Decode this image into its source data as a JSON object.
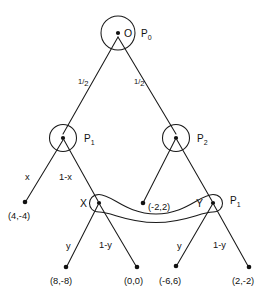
{
  "diagram": {
    "type": "extensive-form-game-tree",
    "nodes": [
      {
        "id": "root",
        "label": "O",
        "player": "P",
        "player_sub": "0",
        "x": 118,
        "y": 33,
        "r": 17,
        "kind": "decision"
      },
      {
        "id": "left",
        "label": "",
        "player": "P",
        "player_sub": "1",
        "x": 63,
        "y": 138,
        "r": 13.5,
        "kind": "decision"
      },
      {
        "id": "right",
        "label": "",
        "player": "P",
        "player_sub": "2",
        "x": 176,
        "y": 138,
        "r": 13.5,
        "kind": "decision"
      },
      {
        "id": "X",
        "label": "X",
        "player": "",
        "player_sub": "",
        "x": 99,
        "y": 203,
        "r": 8.5,
        "kind": "decision"
      },
      {
        "id": "Y",
        "label": "Y",
        "player": "P",
        "player_sub": "1",
        "x": 213,
        "y": 203,
        "r": 8.5,
        "kind": "decision"
      }
    ],
    "terminals": [
      {
        "id": "t1",
        "payoff": "(4,-4)",
        "x": 25,
        "y": 202,
        "label_x": 22,
        "label_y": 216
      },
      {
        "id": "t2",
        "payoff": "(-2,2)",
        "x": 143,
        "y": 203,
        "label_x": 148,
        "label_y": 209
      },
      {
        "id": "t3",
        "payoff": "(8,-8)",
        "x": 66,
        "y": 267,
        "label_x": 52,
        "label_y": 281
      },
      {
        "id": "t4",
        "payoff": "(0,0)",
        "x": 137,
        "y": 267,
        "label_x": 127,
        "label_y": 281
      },
      {
        "id": "t5",
        "payoff": "(-6,6)",
        "x": 176,
        "y": 266,
        "label_x": 162,
        "label_y": 281
      },
      {
        "id": "t6",
        "payoff": "(2,-2)",
        "x": 249,
        "y": 267,
        "label_x": 234,
        "label_y": 281
      }
    ],
    "edges": [
      {
        "id": "e-root-left",
        "from": "root",
        "to": "left",
        "x1": 118,
        "y1": 37,
        "x2": 63,
        "y2": 134
      },
      {
        "id": "e-root-right",
        "from": "root",
        "to": "right",
        "x1": 118,
        "y1": 37,
        "x2": 176,
        "y2": 134
      },
      {
        "id": "e-left-t1",
        "from": "left",
        "to": "t1",
        "x1": 63,
        "y1": 140,
        "x2": 26,
        "y2": 201
      },
      {
        "id": "e-left-X",
        "from": "left",
        "to": "X",
        "x1": 64,
        "y1": 140,
        "x2": 98,
        "y2": 201
      },
      {
        "id": "e-right-t2",
        "from": "right",
        "to": "t2",
        "x1": 175,
        "y1": 140,
        "x2": 144,
        "y2": 201
      },
      {
        "id": "e-right-Y",
        "from": "right",
        "to": "Y",
        "x1": 177,
        "y1": 140,
        "x2": 212,
        "y2": 201
      },
      {
        "id": "e-X-t3",
        "from": "X",
        "to": "t3",
        "x1": 98,
        "y1": 205,
        "x2": 67,
        "y2": 266
      },
      {
        "id": "e-X-t4",
        "from": "X",
        "to": "t4",
        "x1": 100,
        "y1": 205,
        "x2": 136,
        "y2": 266
      },
      {
        "id": "e-Y-t5",
        "from": "Y",
        "to": "t5",
        "x1": 212,
        "y1": 205,
        "x2": 177,
        "y2": 265
      },
      {
        "id": "e-Y-t6",
        "from": "Y",
        "to": "t6",
        "x1": 214,
        "y1": 205,
        "x2": 248,
        "y2": 266
      }
    ],
    "edge_labels": [
      {
        "id": "lbl-root-left",
        "text": "1/2",
        "num": "1",
        "den": "2",
        "x": 83,
        "y": 84,
        "style": "fraction"
      },
      {
        "id": "lbl-root-right",
        "text": "1/2",
        "num": "1",
        "den": "2",
        "x": 139,
        "y": 84,
        "style": "fraction"
      },
      {
        "id": "lbl-left-t1",
        "text": "x",
        "num": "",
        "den": "",
        "x": 28,
        "y": 177,
        "style": "plain"
      },
      {
        "id": "lbl-left-X",
        "text": "1-x",
        "num": "",
        "den": "",
        "x": 63,
        "y": 177,
        "style": "plain"
      },
      {
        "id": "lbl-X-t3",
        "text": "y",
        "num": "",
        "den": "",
        "x": 69,
        "y": 246,
        "style": "plain"
      },
      {
        "id": "lbl-X-t4",
        "text": "1-y",
        "num": "",
        "den": "",
        "x": 103,
        "y": 245,
        "style": "plain"
      },
      {
        "id": "lbl-Y-t5",
        "text": "y",
        "num": "",
        "den": "",
        "x": 180,
        "y": 246,
        "style": "plain"
      },
      {
        "id": "lbl-Y-t6",
        "text": "1-y",
        "num": "",
        "den": "",
        "x": 217,
        "y": 245,
        "style": "plain"
      }
    ],
    "information_set": {
      "id": "infoset-X-Y",
      "members": [
        "X",
        "Y"
      ],
      "description": "elongated oval linking nodes X and Y"
    },
    "node_text": {
      "root_label": "O",
      "root_player": "P",
      "root_player_sub": "0",
      "left_player": "P",
      "left_player_sub": "1",
      "right_player": "P",
      "right_player_sub": "2",
      "x_label": "X",
      "y_label": "Y",
      "y_player": "P",
      "y_player_sub": "1"
    },
    "colors": {
      "stroke": "#1a1a1a",
      "text": "#111111",
      "background": "#ffffff"
    }
  }
}
